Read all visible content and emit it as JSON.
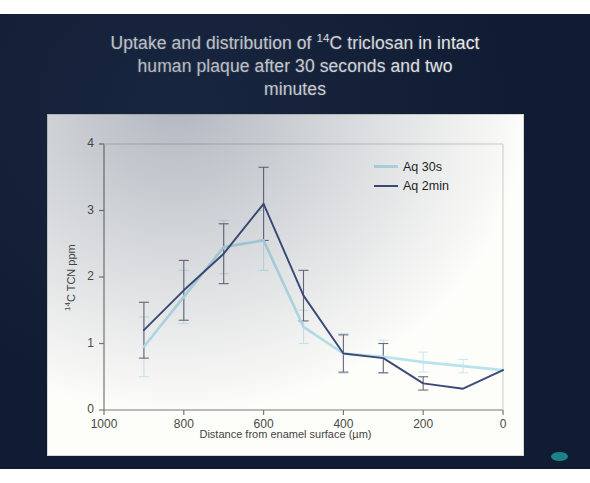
{
  "slide": {
    "background_color": "#101c33",
    "title_line1_pre": "Uptake and distribution of ",
    "title_sup": "14",
    "title_line1_post": "C triclosan in intact",
    "title_line2": "human plaque after 30 seconds and two",
    "title_line3": "minutes",
    "title_plain": "Uptake and distribution of 14C triclosan in intact human plaque after 30 seconds and two minutes",
    "corner_marker": "teal-dot"
  },
  "chart_data": {
    "type": "line",
    "title": "Uptake and distribution of 14C triclosan in intact human plaque after 30 seconds and two minutes",
    "xlabel": "Distance from enamel surface (µm)",
    "ylabel": "14C TCN ppm",
    "ylabel_sup": "14",
    "ylabel_rest": "C TCN ppm",
    "xlabel_pre": "Distance from enamel surface (",
    "xlabel_mu": "µ",
    "xlabel_post": "m)",
    "x": [
      1000,
      900,
      800,
      700,
      600,
      500,
      400,
      300,
      200,
      100,
      0
    ],
    "xlim": [
      1000,
      0
    ],
    "x_reversed": true,
    "ylim": [
      0,
      4
    ],
    "yticks": [
      0,
      1,
      2,
      3,
      4
    ],
    "xticks": [
      1000,
      800,
      600,
      400,
      200,
      0
    ],
    "xtick_labels": [
      "1000",
      "800",
      "600",
      "400",
      "200",
      "0"
    ],
    "ytick_labels": [
      "0",
      "1",
      "2",
      "3",
      "4"
    ],
    "grid": false,
    "legend_position": "top-right",
    "error_bars": true,
    "series": [
      {
        "name": "Aq 30s",
        "color": "#b9e3ec",
        "x": [
          900,
          800,
          700,
          600,
          500,
          400,
          300,
          200,
          100,
          0
        ],
        "values": [
          0.95,
          1.7,
          2.45,
          2.55,
          1.25,
          0.85,
          0.8,
          0.72,
          0.66,
          0.6
        ],
        "errors": [
          0.45,
          0.4,
          0.4,
          0.45,
          0.25,
          0.3,
          0.25,
          0.15,
          0.1,
          0.0
        ]
      },
      {
        "name": "Aq 2min",
        "color": "#3c4a79",
        "x": [
          900,
          800,
          700,
          600,
          500,
          400,
          300,
          200,
          100,
          0
        ],
        "values": [
          1.2,
          1.8,
          2.35,
          3.1,
          1.72,
          0.85,
          0.78,
          0.4,
          0.32,
          0.6
        ],
        "errors": [
          0.42,
          0.45,
          0.45,
          0.55,
          0.38,
          0.28,
          0.22,
          0.1,
          0.0,
          0.0
        ]
      }
    ]
  },
  "legend": {
    "items": [
      {
        "label": "Aq 30s",
        "color": "#b9e3ec"
      },
      {
        "label": "Aq 2min",
        "color": "#3c4a79"
      }
    ]
  }
}
